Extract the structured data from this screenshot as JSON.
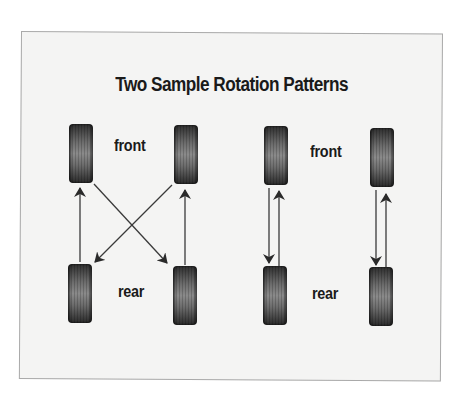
{
  "diagram": {
    "title": "Two Sample Rotation Patterns",
    "colors": {
      "background": "#f4f4f3",
      "border": "#a9a9a9",
      "text": "#1a1a1a",
      "arrow": "#333333",
      "tire": "#555555"
    },
    "patterns": [
      {
        "name": "cross-pattern",
        "labels": {
          "front": "front",
          "rear": "rear"
        },
        "moves": [
          {
            "from": "rear-left",
            "to": "front-left",
            "shape": "straight"
          },
          {
            "from": "rear-right",
            "to": "front-right",
            "shape": "straight"
          },
          {
            "from": "front-left",
            "to": "rear-right",
            "shape": "diagonal"
          },
          {
            "from": "front-right",
            "to": "rear-left",
            "shape": "diagonal"
          }
        ]
      },
      {
        "name": "front-to-rear-pattern",
        "labels": {
          "front": "front",
          "rear": "rear"
        },
        "moves": [
          {
            "from": "front-left",
            "to": "rear-left",
            "shape": "straight"
          },
          {
            "from": "rear-left",
            "to": "front-left",
            "shape": "straight"
          },
          {
            "from": "front-right",
            "to": "rear-right",
            "shape": "straight"
          },
          {
            "from": "rear-right",
            "to": "front-right",
            "shape": "straight"
          }
        ]
      }
    ]
  }
}
